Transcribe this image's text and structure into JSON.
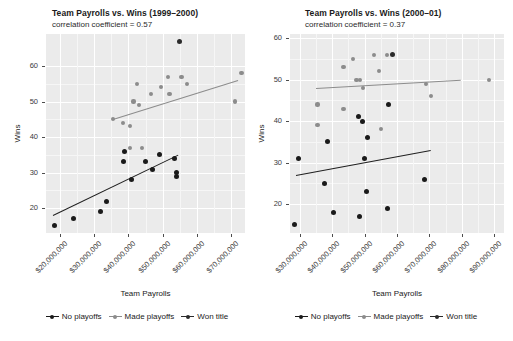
{
  "figure": {
    "width": 513,
    "height": 341,
    "background": "#ffffff",
    "panel_background": "#ebebeb",
    "grid_color": "#ffffff"
  },
  "legend": {
    "entries": [
      {
        "label": "No playoffs",
        "color": "#1a1a1a"
      },
      {
        "label": "Made playoffs",
        "color": "#8c8c8c"
      },
      {
        "label": "Won title",
        "color": "#2b2b2b"
      }
    ]
  },
  "chart_data": [
    {
      "type": "scatter",
      "title": "Team Payrolls vs. Wins (1999–2000)",
      "subtitle": "correlation coefficient = 0.57",
      "xlabel": "Team Payrolls",
      "ylabel": "Wins",
      "grid": true,
      "legend_position": "bottom",
      "xlim": [
        16000000,
        74000000
      ],
      "ylim": [
        13,
        69
      ],
      "xticks": [
        20000000,
        30000000,
        40000000,
        50000000,
        60000000,
        70000000
      ],
      "xtick_labels": [
        "$20,000,000",
        "$30,000,000",
        "$40,000,000",
        "$50,000,000",
        "$60,000,000",
        "$70,000,000"
      ],
      "yticks": [
        20,
        30,
        40,
        50,
        60
      ],
      "ytick_labels": [
        "20",
        "30",
        "40",
        "50",
        "60"
      ],
      "series": [
        {
          "name": "No playoffs",
          "color": "#1a1a1a",
          "points": [
            {
              "x": 18500000,
              "y": 15
            },
            {
              "x": 24000000,
              "y": 17
            },
            {
              "x": 32000000,
              "y": 19
            },
            {
              "x": 33500000,
              "y": 22
            },
            {
              "x": 38500000,
              "y": 33
            },
            {
              "x": 39000000,
              "y": 36
            },
            {
              "x": 41000000,
              "y": 28
            },
            {
              "x": 45000000,
              "y": 33
            },
            {
              "x": 47000000,
              "y": 31
            },
            {
              "x": 49000000,
              "y": 35
            },
            {
              "x": 53500000,
              "y": 34
            },
            {
              "x": 54000000,
              "y": 30
            },
            {
              "x": 54000000,
              "y": 29
            }
          ],
          "trend": {
            "x0": 18000000,
            "y0": 18,
            "x1": 54500000,
            "y1": 35
          }
        },
        {
          "name": "Made playoffs",
          "color": "#8c8c8c",
          "points": [
            {
              "x": 35500000,
              "y": 45
            },
            {
              "x": 38500000,
              "y": 44
            },
            {
              "x": 40500000,
              "y": 43
            },
            {
              "x": 40500000,
              "y": 37
            },
            {
              "x": 41500000,
              "y": 50
            },
            {
              "x": 42500000,
              "y": 55
            },
            {
              "x": 43000000,
              "y": 49
            },
            {
              "x": 44000000,
              "y": 37
            },
            {
              "x": 46500000,
              "y": 52
            },
            {
              "x": 49500000,
              "y": 54
            },
            {
              "x": 51500000,
              "y": 57
            },
            {
              "x": 52000000,
              "y": 52
            },
            {
              "x": 55500000,
              "y": 57
            },
            {
              "x": 57000000,
              "y": 55
            },
            {
              "x": 71000000,
              "y": 50
            },
            {
              "x": 73000000,
              "y": 58
            }
          ],
          "trend": {
            "x0": 35500000,
            "y0": 45,
            "x1": 72000000,
            "y1": 56
          }
        },
        {
          "name": "Won title",
          "color": "#2b2b2b",
          "points": [
            {
              "x": 55000000,
              "y": 67
            }
          ]
        }
      ]
    },
    {
      "type": "scatter",
      "title": "Team Payrolls vs. Wins (2000–01)",
      "subtitle": "correlation coefficient = 0.37",
      "xlabel": "Team Payrolls",
      "ylabel": "Wins",
      "grid": true,
      "legend_position": "bottom",
      "xlim": [
        27000000,
        93000000
      ],
      "ylim": [
        13,
        61
      ],
      "xticks": [
        30000000,
        40000000,
        50000000,
        60000000,
        70000000,
        80000000,
        90000000
      ],
      "xtick_labels": [
        "$30,000,000",
        "$40,000,000",
        "$50,000,000",
        "$60,000,000",
        "$70,000,000",
        "$80,000,000",
        "$90,000,000"
      ],
      "yticks": [
        20,
        30,
        40,
        50,
        60
      ],
      "ytick_labels": [
        "20",
        "30",
        "40",
        "50",
        "60"
      ],
      "series": [
        {
          "name": "No playoffs",
          "color": "#1a1a1a",
          "points": [
            {
              "x": 28500000,
              "y": 15
            },
            {
              "x": 29500000,
              "y": 31
            },
            {
              "x": 37500000,
              "y": 25
            },
            {
              "x": 38500000,
              "y": 35
            },
            {
              "x": 40500000,
              "y": 18
            },
            {
              "x": 48000000,
              "y": 41
            },
            {
              "x": 48500000,
              "y": 17
            },
            {
              "x": 49500000,
              "y": 40
            },
            {
              "x": 50000000,
              "y": 31
            },
            {
              "x": 50500000,
              "y": 23
            },
            {
              "x": 51000000,
              "y": 36
            },
            {
              "x": 57000000,
              "y": 19
            },
            {
              "x": 57500000,
              "y": 44
            },
            {
              "x": 68500000,
              "y": 26
            }
          ],
          "trend": {
            "x0": 29000000,
            "y0": 27,
            "x1": 70500000,
            "y1": 33
          }
        },
        {
          "name": "Made playoffs",
          "color": "#8c8c8c",
          "points": [
            {
              "x": 35500000,
              "y": 44
            },
            {
              "x": 35500000,
              "y": 39
            },
            {
              "x": 43500000,
              "y": 53
            },
            {
              "x": 43500000,
              "y": 43
            },
            {
              "x": 46500000,
              "y": 55
            },
            {
              "x": 47500000,
              "y": 50
            },
            {
              "x": 48500000,
              "y": 50
            },
            {
              "x": 49500000,
              "y": 48
            },
            {
              "x": 53000000,
              "y": 56
            },
            {
              "x": 54500000,
              "y": 52
            },
            {
              "x": 55000000,
              "y": 38
            },
            {
              "x": 57000000,
              "y": 56
            },
            {
              "x": 69000000,
              "y": 49
            },
            {
              "x": 70500000,
              "y": 46
            },
            {
              "x": 88500000,
              "y": 50
            }
          ],
          "trend": {
            "x0": 35000000,
            "y0": 48,
            "x1": 79500000,
            "y1": 50
          }
        },
        {
          "name": "Won title",
          "color": "#2b2b2b",
          "points": [
            {
              "x": 58500000,
              "y": 56
            }
          ]
        }
      ]
    }
  ]
}
